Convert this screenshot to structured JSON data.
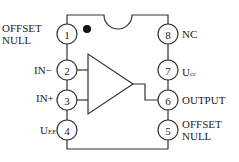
{
  "diagram": {
    "type": "8-pin op-amp IC pinout",
    "pins": [
      {
        "number": "1",
        "label_lines": [
          "OFFSET",
          "NULL"
        ],
        "side": "left"
      },
      {
        "number": "2",
        "label": "IN",
        "label_suffix": "−",
        "side": "left"
      },
      {
        "number": "3",
        "label": "IN",
        "label_suffix": "+",
        "side": "left"
      },
      {
        "number": "4",
        "label": "U",
        "label_sub": "EE",
        "side": "left"
      },
      {
        "number": "5",
        "label_lines": [
          "OFFSET",
          "NULL"
        ],
        "side": "right"
      },
      {
        "number": "6",
        "label": "OUTPUT",
        "side": "right"
      },
      {
        "number": "7",
        "label": "U",
        "label_sub": "cc",
        "side": "right"
      },
      {
        "number": "8",
        "label": "NC",
        "side": "right"
      }
    ],
    "colors": {
      "line": "#333333",
      "text": "#222222",
      "background": "#ffffff"
    }
  }
}
